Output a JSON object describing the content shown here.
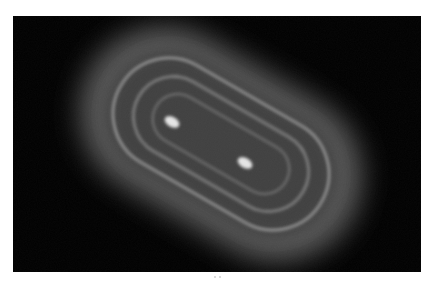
{
  "image": {
    "kind": "intensity-pattern",
    "background": "#000000",
    "page_background": "#ffffff",
    "panel": {
      "x": 13,
      "y": 16,
      "width": 408,
      "height": 256
    },
    "pattern": {
      "center": [
        208,
        128
      ],
      "rotation_deg": 30,
      "outer_glow": {
        "w": 300,
        "h": 170,
        "rx": 85,
        "color": "#5a5a5a",
        "blur": 14
      },
      "mid_glow": {
        "w": 250,
        "h": 130,
        "rx": 65,
        "color": "#404040",
        "blur": 8
      },
      "rings": [
        {
          "w": 232,
          "h": 112,
          "rx": 56,
          "stroke": "#8c8c8c",
          "width": 3,
          "blur": 1.6
        },
        {
          "w": 190,
          "h": 80,
          "rx": 40,
          "stroke": "#7a7a7a",
          "width": 3,
          "blur": 1.6
        },
        {
          "w": 150,
          "h": 50,
          "rx": 25,
          "stroke": "#6a6a6a",
          "width": 2.5,
          "blur": 1.4
        }
      ],
      "spots": [
        {
          "x": 159,
          "y": 106,
          "rx": 8,
          "ry": 5,
          "color": "#e6e6e6"
        },
        {
          "x": 232,
          "y": 147,
          "rx": 8,
          "ry": 5,
          "color": "#e6e6e6"
        }
      ]
    }
  }
}
